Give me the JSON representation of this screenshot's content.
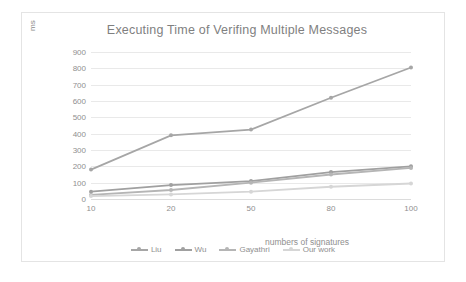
{
  "chart_data": {
    "type": "line",
    "title": "Executing Time of Verifing Multiple Messages",
    "xlabel": "numbers of signatures",
    "ylabel": "ms",
    "categories": [
      "10",
      "20",
      "50",
      "80",
      "100"
    ],
    "yticks": [
      "0",
      "100",
      "200",
      "300",
      "400",
      "500",
      "600",
      "700",
      "800",
      "900"
    ],
    "ylim": [
      0,
      900
    ],
    "grid": true,
    "legend_position": "bottom",
    "series": [
      {
        "name": "Liu",
        "values": [
          180,
          390,
          425,
          620,
          805
        ],
        "color": "#a6a6a6"
      },
      {
        "name": "Wu",
        "values": [
          45,
          85,
          110,
          165,
          200
        ],
        "color": "#a0a0a0"
      },
      {
        "name": "Gayathri",
        "values": [
          25,
          55,
          100,
          150,
          190
        ],
        "color": "#b5b5b5"
      },
      {
        "name": "Our work",
        "values": [
          18,
          28,
          45,
          75,
          95
        ],
        "color": "#d6d6d6"
      }
    ]
  }
}
